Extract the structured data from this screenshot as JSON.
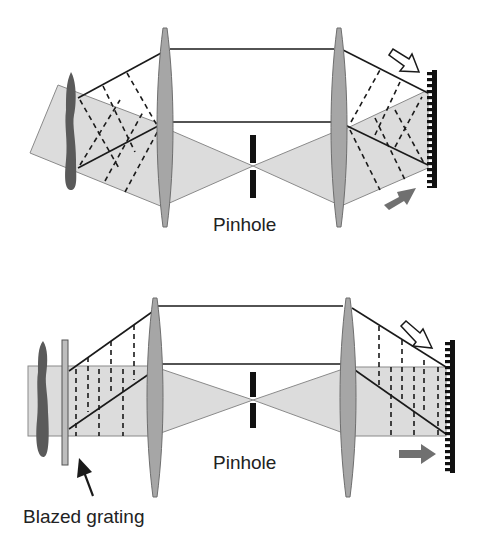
{
  "colors": {
    "background": "#ffffff",
    "beam_fill": "#dcdcdc",
    "beam_edge": "#8a8a8a",
    "lens_fill": "#a6a6a6",
    "lens_edge": "#6e6e6e",
    "ray": "#1a1a1a",
    "object": "#5a5a5a",
    "pinhole": "#111111",
    "grating": "#111111",
    "filled_arrow": "#707070"
  },
  "top_diagram": {
    "pinhole_label": "Pinhole",
    "components": [
      "object",
      "lens-1",
      "pinhole",
      "lens-2",
      "grating",
      "hollow-arrow",
      "filled-arrow"
    ]
  },
  "bottom_diagram": {
    "pinhole_label": "Pinhole",
    "grating_label": "Blazed grating",
    "components": [
      "object",
      "blazed-grating",
      "lens-1",
      "pinhole",
      "lens-2",
      "grating",
      "hollow-arrow",
      "filled-arrow",
      "pointer-arrow"
    ]
  }
}
